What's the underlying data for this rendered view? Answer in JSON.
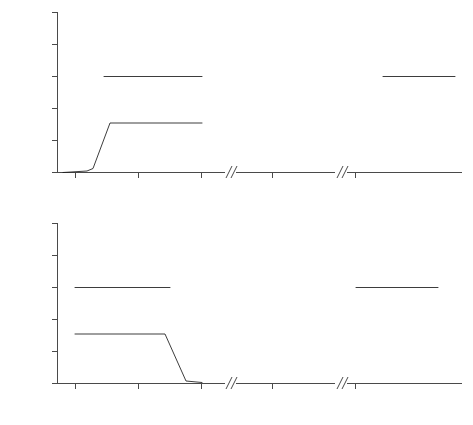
{
  "figure": {
    "axis_titles": {
      "y": "Hz",
      "x": "Time in ms"
    },
    "colors": {
      "axis": "#4a4a4a",
      "data": "#1a1a1a",
      "background": "#ffffff"
    }
  },
  "chart_data": [
    {
      "type": "line",
      "panel": "top",
      "title": "",
      "xlabel": "",
      "ylabel": "Hz",
      "ylim": [
        0,
        2500
      ],
      "yticks": [
        0,
        500,
        1000,
        1500,
        2000,
        2500
      ],
      "ytick_labels": [
        "0",
        "500",
        "1000",
        "1500",
        "2000",
        "2500"
      ],
      "grid": false,
      "legend": "none",
      "segments": [
        {
          "name": "segment-1",
          "xlim": [
            -20,
            230
          ],
          "xticks": [
            0,
            100,
            200
          ],
          "xtick_labels": [
            "0",
            "100",
            "200"
          ],
          "axis_break_right": true,
          "series": [
            {
              "name": "F2-locus-fan",
              "kind": "fan",
              "description": "converging fan of rays from varying onset frequencies to a common F2 target",
              "apex": {
                "x": 45,
                "y": 1600
              },
              "onset_x": 10,
              "onset_y_range": [
                1000,
                2200
              ],
              "ray_count": 28,
              "tail": {
                "x_end": 180,
                "y": 1600
              }
            },
            {
              "name": "F1-trajectory",
              "kind": "line",
              "x": [
                -18,
                18,
                28,
                55,
                200
              ],
              "y": [
                0,
                10,
                60,
                770,
                770
              ]
            }
          ]
        },
        {
          "name": "segment-2",
          "xlim": [
            -45,
            55
          ],
          "xticks": [
            0
          ],
          "xtick_labels": [
            "0"
          ],
          "axis_break_left": true,
          "axis_break_right": true,
          "series": [
            {
              "name": "F2-locus-fan",
              "kind": "fan",
              "description": "converging fan, no steady-state tail",
              "apex": {
                "x": 8,
                "y": 1600
              },
              "onset_x": -30,
              "onset_y_range": [
                1000,
                2200
              ],
              "ray_count": 28,
              "tail": null
            }
          ]
        },
        {
          "name": "segment-3",
          "xlim": [
            -45,
            115
          ],
          "xticks": [
            0
          ],
          "xtick_labels": [
            "0"
          ],
          "axis_break_left": true,
          "series": [
            {
              "name": "F2-locus-fan",
              "kind": "fan",
              "description": "converging fan with steady-state tail",
              "apex": {
                "x": 8,
                "y": 1600
              },
              "onset_x": -32,
              "onset_y_range": [
                1000,
                2200
              ],
              "ray_count": 28,
              "tail": {
                "x_end": 105,
                "y": 1600
              }
            }
          ]
        }
      ]
    },
    {
      "type": "line",
      "panel": "bottom",
      "title": "",
      "xlabel": "Time in ms",
      "ylabel": "Hz",
      "ylim": [
        0,
        2500
      ],
      "yticks": [
        0,
        500,
        1000,
        1500,
        2000,
        2500
      ],
      "ytick_labels": [
        "0",
        "500",
        "1000",
        "1500",
        "2000",
        "2500"
      ],
      "grid": false,
      "legend": "none",
      "segments": [
        {
          "name": "segment-1",
          "xlim": [
            -20,
            230
          ],
          "xticks": [
            0,
            100,
            200
          ],
          "xtick_labels": [
            "0",
            "100",
            "200"
          ],
          "axis_break_right": true,
          "series": [
            {
              "name": "F2-locus-fan",
              "kind": "fan",
              "description": "diverging fan leaving a common F2 locus toward varied offsets",
              "apex": {
                "x": 148,
                "y": 1600
              },
              "offset_x": 195,
              "offset_y_range": [
                1000,
                2200
              ],
              "ray_count": 28,
              "lead": {
                "x_start": 0,
                "y": 1600
              }
            },
            {
              "name": "F1-trajectory",
              "kind": "line",
              "x": [
                0,
                143,
                180,
                200
              ],
              "y": [
                770,
                770,
                30,
                20
              ]
            }
          ]
        },
        {
          "name": "segment-2",
          "xlim": [
            -45,
            55
          ],
          "xticks": [
            0
          ],
          "xtick_labels": [
            "0"
          ],
          "axis_break_left": true,
          "axis_break_right": true,
          "series": [
            {
              "name": "F2-locus-fan",
              "kind": "fan",
              "description": "diverging fan, no steady-state lead",
              "apex": {
                "x": -18,
                "y": 1600
              },
              "offset_x": 22,
              "offset_y_range": [
                1000,
                2200
              ],
              "ray_count": 28,
              "lead": null
            }
          ]
        },
        {
          "name": "segment-3",
          "xlim": [
            -45,
            115
          ],
          "xticks": [
            0
          ],
          "xtick_labels": [
            "0"
          ],
          "axis_break_left": true,
          "series": [
            {
              "name": "F2-locus-fan",
              "kind": "fan",
              "description": "diverging fan with steady-state lead",
              "apex": {
                "x": 72,
                "y": 1600
              },
              "offset_x": 110,
              "offset_y_range": [
                1000,
                2200
              ],
              "ray_count": 28,
              "lead": {
                "x_start": -20,
                "y": 1600
              }
            }
          ]
        }
      ]
    }
  ]
}
